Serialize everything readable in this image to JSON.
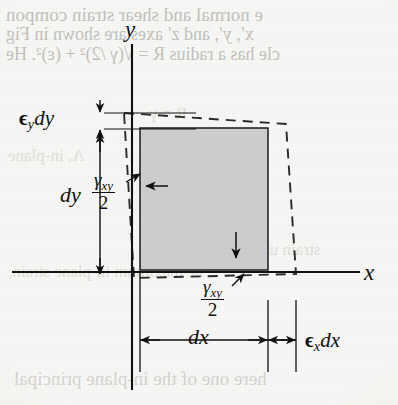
{
  "figure": {
    "kind": "strain-deformation-element",
    "axes": {
      "y_label": "y",
      "x_label": "x",
      "y_axis_x": 132,
      "x_axis_y": 272
    },
    "element": {
      "fill_color": "#cdcdcd",
      "stroke_color": "#1a1a1a",
      "left": 140,
      "top": 128,
      "right": 268,
      "bottom": 270
    },
    "deformed_outline": {
      "style": "dashed",
      "stroke_color": "#2a2a2a"
    },
    "labels": {
      "epsilon_y_dy": {
        "epsilon": "ϵ",
        "sub": "y",
        "term": "dy",
        "x": 18,
        "y": 112
      },
      "dy": {
        "text": "dy",
        "x": 62,
        "y": 186
      },
      "gamma_xy_over_2_left": {
        "gamma": "γ",
        "sub": "xy",
        "den": "2",
        "x": 97,
        "y": 168
      },
      "gamma_xy_over_2_bottom": {
        "gamma": "γ",
        "sub": "xy",
        "den": "2",
        "x": 205,
        "y": 280
      },
      "dx": {
        "text": "dx",
        "x": 189,
        "y": 340
      },
      "epsilon_x_dx": {
        "epsilon": "ϵ",
        "sub": "x",
        "term": "dx",
        "x": 324,
        "y": 337
      }
    }
  },
  "colors": {
    "page_background": "#f6f6f4",
    "element_gray": "#cdcdcd",
    "ink": "#111111",
    "bleed_ink": "#b9b9b3"
  },
  "bleedthrough": {
    "note": "faint mirrored text showing through from the reverse side of the scanned page",
    "lines": [
      {
        "text": "e normal and shear strain compon",
        "x": 6,
        "y": 4,
        "size": 19
      },
      {
        "text": "x′, y′, and z′ axes are shown in Fig",
        "x": 6,
        "y": 24,
        "size": 18
      },
      {
        "text": "cle has a radius R = √(γ /2)² + (ε)². He",
        "x": 6,
        "y": 44,
        "size": 18
      },
      {
        "text": "R = γ",
        "x": 150,
        "y": 104,
        "size": 17
      },
      {
        "text": "A, in-plane",
        "x": 8,
        "y": 146,
        "size": 17
      },
      {
        "text": "strain used for the",
        "x": 198,
        "y": 240,
        "size": 17
      },
      {
        "text": "he maximum in-plane strain,",
        "x": 8,
        "y": 262,
        "size": 17
      },
      {
        "text": "here one of the in-plane principal",
        "x": 14,
        "y": 368,
        "size": 19
      }
    ]
  }
}
